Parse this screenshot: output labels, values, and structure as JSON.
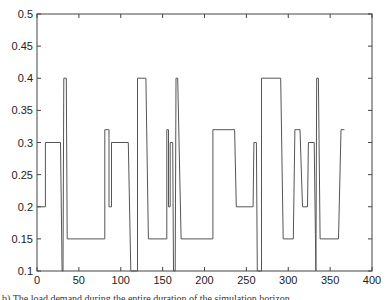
{
  "chart_data": {
    "type": "line",
    "title": "",
    "xlabel": "",
    "ylabel": "",
    "xlim": [
      0,
      400
    ],
    "ylim": [
      0.1,
      0.5
    ],
    "xticks": [
      0,
      50,
      100,
      150,
      200,
      250,
      300,
      350,
      400
    ],
    "yticks": [
      0.1,
      0.15,
      0.2,
      0.25,
      0.3,
      0.35,
      0.4,
      0.45,
      0.5
    ],
    "xtick_labels": [
      "0",
      "50",
      "100",
      "150",
      "200",
      "250",
      "300",
      "350",
      "400"
    ],
    "ytick_labels": [
      "0.1",
      "0.15",
      "0.2",
      "0.25",
      "0.3",
      "0.35",
      "0.4",
      "0.45",
      "0.5"
    ],
    "grid": false,
    "legend": null,
    "line_color": "#555555",
    "series": [
      {
        "name": "step-signal",
        "x": [
          0,
          10,
          10,
          28,
          30,
          31,
          32,
          35,
          36,
          40,
          81,
          81,
          86,
          86,
          89,
          89,
          109,
          112,
          113,
          118,
          119,
          120,
          120,
          130,
          133,
          155,
          155,
          157,
          157,
          159,
          159,
          162,
          163,
          165,
          166,
          168,
          172,
          210,
          210,
          236,
          238,
          258,
          259,
          262,
          263,
          267,
          268,
          268,
          291,
          294,
          306,
          308,
          314,
          317,
          323,
          324,
          331,
          333,
          334,
          336,
          338,
          340,
          360,
          363,
          367
        ],
        "y": [
          0.2,
          0.2,
          0.3,
          0.3,
          0.1,
          0.1,
          0.4,
          0.4,
          0.15,
          0.15,
          0.15,
          0.32,
          0.32,
          0.2,
          0.2,
          0.3,
          0.3,
          0.1,
          0.1,
          0.1,
          0.1,
          0.1,
          0.4,
          0.4,
          0.15,
          0.15,
          0.32,
          0.32,
          0.2,
          0.2,
          0.3,
          0.3,
          0.1,
          0.1,
          0.4,
          0.4,
          0.15,
          0.15,
          0.32,
          0.32,
          0.2,
          0.2,
          0.3,
          0.3,
          0.1,
          0.1,
          0.1,
          0.4,
          0.4,
          0.15,
          0.15,
          0.32,
          0.32,
          0.2,
          0.2,
          0.3,
          0.3,
          0.1,
          0.4,
          0.4,
          0.15,
          0.15,
          0.15,
          0.32,
          0.32
        ]
      }
    ]
  },
  "caption": "b) The load demand during the entire duration of the simulation horizon"
}
